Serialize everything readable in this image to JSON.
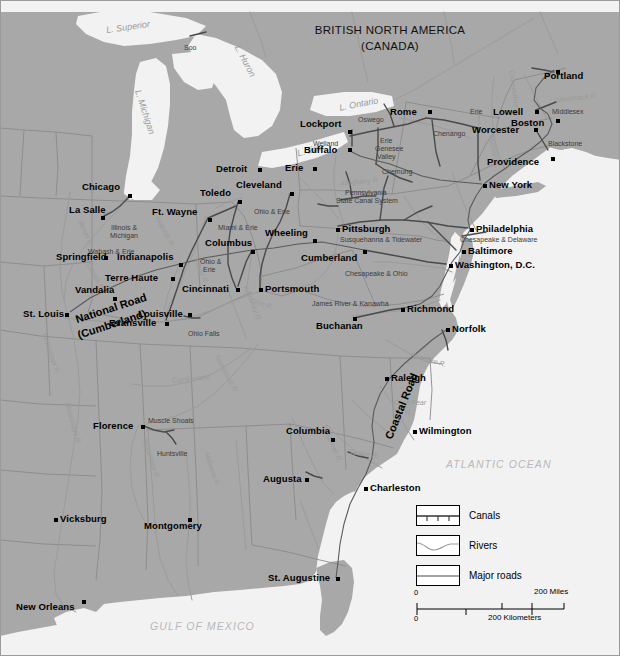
{
  "map": {
    "title_line1": "BRITISH NORTH AMERICA",
    "title_line2": "(CANADA)",
    "oceans": [
      {
        "name": "ATLANTIC OCEAN",
        "x": 446,
        "y": 458
      },
      {
        "name": "GULF OF MEXICO",
        "x": 150,
        "y": 620
      }
    ],
    "lakes": [
      {
        "name": "L. Superior",
        "x": 106,
        "y": 22,
        "rot": -8
      },
      {
        "name": "L. Michigan",
        "x": 122,
        "y": 107,
        "rot": 72
      },
      {
        "name": "L. Huron",
        "x": 228,
        "y": 56,
        "rot": 62
      },
      {
        "name": "L. Ontario",
        "x": 339,
        "y": 99,
        "rot": -11
      },
      {
        "name": "L. Erie",
        "x": 297,
        "y": 145,
        "rot": -16
      }
    ],
    "cities": [
      {
        "name": "Portland",
        "x": 556,
        "y": 70,
        "dx": -12,
        "dy": 4,
        "anchor": "left"
      },
      {
        "name": "Lowell",
        "x": 535,
        "y": 110,
        "dx": -42,
        "dy": 0,
        "anchor": "left"
      },
      {
        "name": "Boston",
        "x": 556,
        "y": 119,
        "dx": -45,
        "dy": 2,
        "anchor": "left"
      },
      {
        "name": "Worcester",
        "x": 534,
        "y": 128,
        "dx": -62,
        "dy": 0,
        "anchor": "left"
      },
      {
        "name": "Providence",
        "x": 551,
        "y": 157,
        "dx": -64,
        "dy": 3,
        "anchor": "left"
      },
      {
        "name": "Rome",
        "x": 428,
        "y": 110,
        "dx": -38,
        "dy": 0,
        "anchor": "left"
      },
      {
        "name": "Lockport",
        "x": 348,
        "y": 130,
        "dx": -48,
        "dy": -8,
        "anchor": "left"
      },
      {
        "name": "Buffalo",
        "x": 348,
        "y": 148,
        "dx": -44,
        "dy": 0,
        "anchor": "left"
      },
      {
        "name": "Erie",
        "x": 313,
        "y": 167,
        "dx": -28,
        "dy": -1,
        "anchor": "left"
      },
      {
        "name": "New York",
        "x": 483,
        "y": 184,
        "dx": 6,
        "dy": -1,
        "anchor": "left"
      },
      {
        "name": "Philadelphia",
        "x": 470,
        "y": 228,
        "dx": 6,
        "dy": -1,
        "anchor": "left"
      },
      {
        "name": "Baltimore",
        "x": 462,
        "y": 250,
        "dx": 6,
        "dy": -1,
        "anchor": "left"
      },
      {
        "name": "Washington, D.C.",
        "x": 449,
        "y": 264,
        "dx": 6,
        "dy": -1,
        "anchor": "left"
      },
      {
        "name": "Richmond",
        "x": 401,
        "y": 308,
        "dx": 6,
        "dy": -1,
        "anchor": "left"
      },
      {
        "name": "Norfolk",
        "x": 446,
        "y": 328,
        "dx": 6,
        "dy": -1,
        "anchor": "left"
      },
      {
        "name": "Pittsburgh",
        "x": 336,
        "y": 228,
        "dx": 6,
        "dy": -1,
        "anchor": "left"
      },
      {
        "name": "Cumberland",
        "x": 363,
        "y": 250,
        "dx": -62,
        "dy": 6,
        "anchor": "left"
      },
      {
        "name": "Wheeling",
        "x": 313,
        "y": 239,
        "dx": -48,
        "dy": -8,
        "anchor": "left"
      },
      {
        "name": "Buchanan",
        "x": 353,
        "y": 317,
        "dx": -37,
        "dy": 7,
        "anchor": "left"
      },
      {
        "name": "Columbus",
        "x": 251,
        "y": 250,
        "dx": -46,
        "dy": -9,
        "anchor": "left"
      },
      {
        "name": "Portsmouth",
        "x": 259,
        "y": 288,
        "dx": 6,
        "dy": -1,
        "anchor": "left"
      },
      {
        "name": "Cincinnati",
        "x": 236,
        "y": 288,
        "dx": -54,
        "dy": -1,
        "anchor": "left"
      },
      {
        "name": "Cleveland",
        "x": 290,
        "y": 192,
        "dx": -54,
        "dy": -9,
        "anchor": "left"
      },
      {
        "name": "Toledo",
        "x": 238,
        "y": 200,
        "dx": -38,
        "dy": -9,
        "anchor": "left"
      },
      {
        "name": "Detroit",
        "x": 258,
        "y": 168,
        "dx": -42,
        "dy": -1,
        "anchor": "left"
      },
      {
        "name": "Chicago",
        "x": 128,
        "y": 194,
        "dx": -46,
        "dy": -9,
        "anchor": "left"
      },
      {
        "name": "La Salle",
        "x": 101,
        "y": 216,
        "dx": -32,
        "dy": -8,
        "anchor": "left"
      },
      {
        "name": "Ft. Wayne",
        "x": 208,
        "y": 218,
        "dx": -56,
        "dy": -8,
        "anchor": "left"
      },
      {
        "name": "Indianapolis",
        "x": 179,
        "y": 263,
        "dx": -62,
        "dy": -8,
        "anchor": "left"
      },
      {
        "name": "Springfield",
        "x": 104,
        "y": 256,
        "dx": -48,
        "dy": -1,
        "anchor": "left"
      },
      {
        "name": "Terre Haute",
        "x": 171,
        "y": 277,
        "dx": -66,
        "dy": -1,
        "anchor": "left"
      },
      {
        "name": "Vandalia",
        "x": 113,
        "y": 297,
        "dx": -38,
        "dy": -9,
        "anchor": "left"
      },
      {
        "name": "St. Louis",
        "x": 65,
        "y": 313,
        "dx": -42,
        "dy": -1,
        "anchor": "left"
      },
      {
        "name": "Evansville",
        "x": 165,
        "y": 322,
        "dx": -56,
        "dy": -1,
        "anchor": "left"
      },
      {
        "name": "Louisville",
        "x": 188,
        "y": 313,
        "dx": -50,
        "dy": -1,
        "anchor": "left"
      },
      {
        "name": "Florence",
        "x": 141,
        "y": 425,
        "dx": -48,
        "dy": -1,
        "anchor": "left"
      },
      {
        "name": "Columbia",
        "x": 331,
        "y": 438,
        "dx": -45,
        "dy": -9,
        "anchor": "left"
      },
      {
        "name": "Augusta",
        "x": 305,
        "y": 478,
        "dx": -42,
        "dy": -1,
        "anchor": "left"
      },
      {
        "name": "Charleston",
        "x": 364,
        "y": 487,
        "dx": 6,
        "dy": -1,
        "anchor": "left"
      },
      {
        "name": "Raleigh",
        "x": 385,
        "y": 377,
        "dx": 6,
        "dy": -1,
        "anchor": "left"
      },
      {
        "name": "Wilmington",
        "x": 413,
        "y": 430,
        "dx": 6,
        "dy": -1,
        "anchor": "left"
      },
      {
        "name": "Montgomery",
        "x": 188,
        "y": 518,
        "dx": -44,
        "dy": 6,
        "anchor": "left"
      },
      {
        "name": "Vicksburg",
        "x": 54,
        "y": 518,
        "dx": 6,
        "dy": -1,
        "anchor": "left"
      },
      {
        "name": "New Orleans",
        "x": 82,
        "y": 600,
        "dx": -66,
        "dy": 5,
        "anchor": "left"
      },
      {
        "name": "St. Augustine",
        "x": 336,
        "y": 577,
        "dx": -68,
        "dy": -1,
        "anchor": "left"
      }
    ],
    "canal_labels": [
      {
        "name": "Soo",
        "x": 184,
        "y": 44
      },
      {
        "name": "Oswego",
        "x": 358,
        "y": 116
      },
      {
        "name": "Erie",
        "x": 470,
        "y": 108
      },
      {
        "name": "Erie",
        "x": 380,
        "y": 137
      },
      {
        "name": "Genesee",
        "x": 375,
        "y": 145
      },
      {
        "name": "Valley",
        "x": 377,
        "y": 153
      },
      {
        "name": "Welland",
        "x": 313,
        "y": 140
      },
      {
        "name": "Chenango",
        "x": 433,
        "y": 130
      },
      {
        "name": "Chemung",
        "x": 382,
        "y": 168
      },
      {
        "name": "Middlesex",
        "x": 552,
        "y": 108
      },
      {
        "name": "Blackstone",
        "x": 548,
        "y": 140
      },
      {
        "name": "Pennsylvania",
        "x": 345,
        "y": 189
      },
      {
        "name": "State Canal System",
        "x": 336,
        "y": 197
      },
      {
        "name": "Susquehanna & Tidewater",
        "x": 340,
        "y": 236
      },
      {
        "name": "Chesapeake & Delaware",
        "x": 460,
        "y": 236
      },
      {
        "name": "Chesapeake & Ohio",
        "x": 345,
        "y": 270
      },
      {
        "name": "James River & Kanawha",
        "x": 312,
        "y": 300
      },
      {
        "name": "Ohio & Erie",
        "x": 254,
        "y": 208
      },
      {
        "name": "Miami & Erie",
        "x": 218,
        "y": 224
      },
      {
        "name": "Ohio &",
        "x": 200,
        "y": 258
      },
      {
        "name": "Erie",
        "x": 203,
        "y": 266
      },
      {
        "name": "Ohio Falls",
        "x": 188,
        "y": 330
      },
      {
        "name": "Illinois &",
        "x": 111,
        "y": 224
      },
      {
        "name": "Michigan",
        "x": 110,
        "y": 232
      },
      {
        "name": "Wabash & Erie",
        "x": 88,
        "y": 248
      },
      {
        "name": "Muscle Shoals",
        "x": 148,
        "y": 417
      },
      {
        "name": "Huntsville",
        "x": 157,
        "y": 450
      }
    ],
    "rivers": [
      {
        "name": "Merrimack R.",
        "x": 556,
        "y": 94,
        "rot": -6
      },
      {
        "name": "Allegheny R.",
        "x": 340,
        "y": 178,
        "rot": -6
      },
      {
        "name": "Illinois R.",
        "x": 72,
        "y": 230,
        "rot": 66
      },
      {
        "name": "Wabash R.",
        "x": 148,
        "y": 228,
        "rot": 62
      },
      {
        "name": "Wabash R.",
        "x": 78,
        "y": 272,
        "rot": 60
      },
      {
        "name": "White R.",
        "x": 188,
        "y": 268,
        "rot": 66
      },
      {
        "name": "Ohio R.",
        "x": 250,
        "y": 300,
        "rot": 16
      },
      {
        "name": "Kentucky R.",
        "x": 234,
        "y": 300,
        "rot": 68
      },
      {
        "name": "Cumberland",
        "x": 172,
        "y": 375,
        "rot": -6
      },
      {
        "name": "Tennessee R.",
        "x": 205,
        "y": 370,
        "rot": 62
      },
      {
        "name": "Tennessee R.",
        "x": 130,
        "y": 455,
        "rot": 72
      },
      {
        "name": "Alabama R.",
        "x": 194,
        "y": 465,
        "rot": 72
      },
      {
        "name": "Mississippi R.",
        "x": 52,
        "y": 420,
        "rot": 74
      },
      {
        "name": "Mississippi R.",
        "x": 30,
        "y": 350,
        "rot": 72
      },
      {
        "name": "Savannah R.",
        "x": 312,
        "y": 440,
        "rot": 66
      },
      {
        "name": "Santee R.",
        "x": 348,
        "y": 450,
        "rot": 8
      },
      {
        "name": "Roanoke R.",
        "x": 410,
        "y": 356,
        "rot": 16
      },
      {
        "name": "Cape Fear",
        "x": 393,
        "y": 399,
        "rot": 0
      },
      {
        "name": "R.",
        "x": 405,
        "y": 409,
        "rot": 0
      },
      {
        "name": "Hudson R.",
        "x": 478,
        "y": 148,
        "rot": 80
      },
      {
        "name": "Connecticut R.",
        "x": 492,
        "y": 90,
        "rot": 82
      }
    ],
    "roads": [
      {
        "name": "National Road",
        "x": 74,
        "y": 302,
        "rot": -18
      },
      {
        "name": "(Cumberland)",
        "x": 76,
        "y": 318,
        "rot": -18
      },
      {
        "name": "Coastal Road",
        "x": 366,
        "y": 400,
        "rot": -68
      }
    ]
  },
  "legend": {
    "items": [
      {
        "label": "Canals",
        "icon": "canal-swatch"
      },
      {
        "label": "Rivers",
        "icon": "river-swatch"
      },
      {
        "label": "Major roads",
        "icon": "road-swatch"
      }
    ]
  },
  "scale": {
    "miles_start": "0",
    "miles_end": "200 Miles",
    "km_start": "0",
    "km_end": "200 Kilometers"
  },
  "colors": {
    "land": "#a8a8a8",
    "water": "#f2f2f2",
    "border": "#8e8e8e",
    "canal": "#4a4a4a",
    "river": "#9b9b9b",
    "frame": "#808080"
  }
}
